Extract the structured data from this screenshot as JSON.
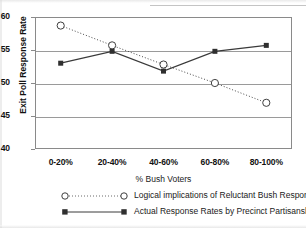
{
  "chart_data": {
    "type": "line",
    "title": "",
    "xlabel": "% Bush Voters",
    "ylabel": "Exit Poll Response Rate",
    "categories": [
      "0-20%",
      "20-40%",
      "40-60%",
      "60-80%",
      "80-100%"
    ],
    "ylim": [
      40,
      60
    ],
    "yticks": [
      40,
      45,
      50,
      55,
      60
    ],
    "grid": true,
    "legend_position": "bottom-left",
    "series": [
      {
        "name": "Logical implications of Reluctant Bush Respondent Theory",
        "marker": "open-circle",
        "linestyle": "dotted",
        "color": "#4a4a4a",
        "values": [
          58.7,
          55.7,
          52.8,
          50.0,
          47.0
        ]
      },
      {
        "name": "Actual Response Rates by Precinct Partisanship",
        "marker": "filled-square",
        "linestyle": "solid",
        "color": "#3a3a3a",
        "values": [
          53.0,
          54.8,
          51.8,
          54.8,
          55.7
        ]
      }
    ]
  },
  "axis": {
    "y_title": "Exit Poll Response Rate",
    "x_title": "% Bush Voters",
    "y_tick_0": "40",
    "y_tick_1": "45",
    "y_tick_2": "50",
    "y_tick_3": "55",
    "y_tick_4": "60",
    "x_tick_0": "0-20%",
    "x_tick_1": "20-40%",
    "x_tick_2": "40-60%",
    "x_tick_3": "60-80%",
    "x_tick_4": "80-100%"
  },
  "legend": {
    "item_0": "Logical implications of Reluctant Bush Respondent Theory",
    "item_1": "Actual Response Rates by Precinct Partisanship"
  }
}
